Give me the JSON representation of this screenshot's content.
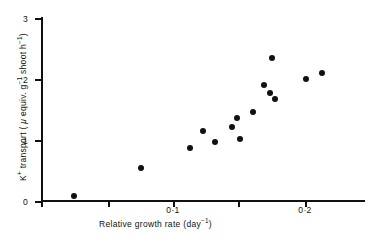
{
  "chart_data": {
    "type": "scatter",
    "title": "",
    "xlabel": "Relative growth rate (day⁻¹)",
    "ylabel": "K⁺ transport ( μ equiv. g⁻¹ shoot h⁻¹)",
    "xlim": [
      0.0,
      0.2455
    ],
    "ylim": [
      0,
      3
    ],
    "grid": false,
    "legend": null,
    "xticks": [
      {
        "value": 0.0,
        "label": "",
        "px": 41
      },
      {
        "value": 0.05,
        "label": "",
        "px": 108
      },
      {
        "value": 0.1,
        "label": "0·1",
        "px": 173
      },
      {
        "value": 0.15,
        "label": "",
        "px": 238
      },
      {
        "value": 0.2,
        "label": "0·2",
        "px": 305
      }
    ],
    "yticks": [
      {
        "value": 0,
        "label": "0",
        "px": 201
      },
      {
        "value": 1,
        "label": "1",
        "px": 140
      },
      {
        "value": 2,
        "label": "2",
        "px": 79
      },
      {
        "value": 3,
        "label": "3",
        "px": 18
      }
    ],
    "points": [
      {
        "x": 0.025,
        "y": 0.08,
        "px": 74,
        "py": 196
      },
      {
        "x": 0.076,
        "y": 0.54,
        "px": 141,
        "py": 168
      },
      {
        "x": 0.113,
        "y": 0.87,
        "px": 190,
        "py": 148
      },
      {
        "x": 0.123,
        "y": 1.15,
        "px": 203,
        "py": 131
      },
      {
        "x": 0.132,
        "y": 0.97,
        "px": 215,
        "py": 142
      },
      {
        "x": 0.145,
        "y": 1.21,
        "px": 232,
        "py": 127
      },
      {
        "x": 0.149,
        "y": 1.36,
        "px": 237,
        "py": 118
      },
      {
        "x": 0.152,
        "y": 1.02,
        "px": 240,
        "py": 139
      },
      {
        "x": 0.169,
        "y": 1.9,
        "px": 264,
        "py": 85
      },
      {
        "x": 0.175,
        "y": 2.33,
        "px": 272,
        "py": 58
      },
      {
        "x": 0.174,
        "y": 1.77,
        "px": 270,
        "py": 93
      },
      {
        "x": 0.178,
        "y": 1.67,
        "px": 275,
        "py": 99
      },
      {
        "x": 0.201,
        "y": 1.99,
        "px": 306,
        "py": 79
      },
      {
        "x": 0.213,
        "y": 2.1,
        "px": 322,
        "py": 73
      },
      {
        "x": 0.161,
        "y": 1.46,
        "px": 253,
        "py": 112
      }
    ]
  },
  "axis_titles": {
    "x_prefix": "Relative growth rate (day",
    "x_sup": "−1",
    "x_suffix": ")",
    "y_k": "K",
    "y_k_sup": "+",
    "y_mid": " transport ( ",
    "y_mu": "μ",
    "y_equiv": " equiv. g",
    "y_sup1": "−1",
    "y_shoot": " shoot h",
    "y_sup2": "−1",
    "y_end": ")"
  },
  "colors": {
    "marker": "#111111",
    "axis": "#111111",
    "background": "#ffffff"
  }
}
